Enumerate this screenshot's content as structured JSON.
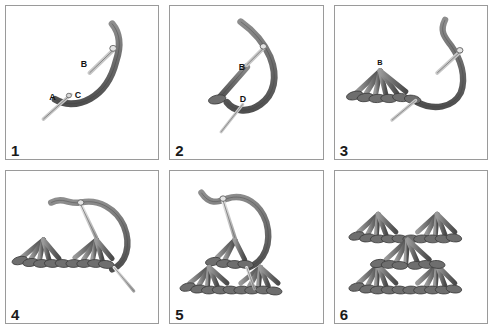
{
  "figure": {
    "background_color": "#ffffff",
    "panel_border_color": "#9a9a9a",
    "thread_color": "#7a7a7a",
    "thread_dark_color": "#565656",
    "thread_light_color": "#a8a8a8",
    "needle_color": "#cfcfcf",
    "needle_outline_color": "#6e6e6e",
    "label_color": "#111111",
    "columns": 3,
    "rows": 2
  },
  "panels": [
    {
      "number": "1",
      "caption": "Needle emerges at A, thread loops to B, re-enters at C",
      "labels": [
        {
          "text": "A",
          "x": 48,
          "y": 93
        },
        {
          "text": "C",
          "x": 72,
          "y": 93
        },
        {
          "text": "B",
          "x": 79,
          "y": 60
        }
      ]
    },
    {
      "number": "2",
      "caption": "Needle carries thread down from B and exits at D",
      "labels": [
        {
          "text": "B",
          "x": 73,
          "y": 62
        },
        {
          "text": "D",
          "x": 74,
          "y": 95
        }
      ]
    },
    {
      "number": "3",
      "caption": "Completed fan of radiating spokes anchored at B",
      "labels": [
        {
          "text": "B",
          "x": 46,
          "y": 58
        }
      ]
    },
    {
      "number": "4",
      "caption": "A second fan is worked along the base row",
      "labels": []
    },
    {
      "number": "5",
      "caption": "A new row of fans is begun above the first row",
      "labels": []
    },
    {
      "number": "6",
      "caption": "Finished staggered pattern of interlocking fans",
      "labels": []
    }
  ]
}
